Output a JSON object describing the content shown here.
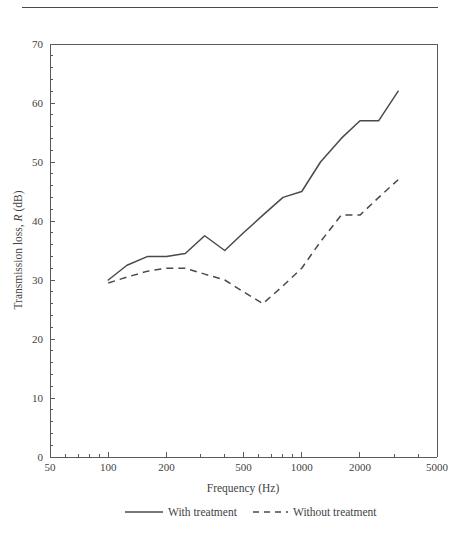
{
  "figure": {
    "has_top_rule": true,
    "background_color": "#ffffff",
    "line_color": "#4a4a4a"
  },
  "chart_data": {
    "type": "line",
    "title": "",
    "xlabel": "Frequency (Hz)",
    "ylabel": "Transmission loss, R (dB)",
    "ylabel_parts": {
      "prefix": "Transmission loss, ",
      "italic": "R",
      "suffix": " (dB)"
    },
    "xscale": "log",
    "yscale": "linear",
    "xlim": [
      50,
      5000
    ],
    "ylim": [
      0,
      70
    ],
    "grid": false,
    "legend_position": "bottom-outside",
    "x_ticks": [
      50,
      100,
      200,
      500,
      1000,
      2000,
      5000
    ],
    "x_tick_labels": [
      "50",
      "100",
      "200",
      "500",
      "1000",
      "2000",
      "5000"
    ],
    "y_ticks": [
      0,
      10,
      20,
      30,
      40,
      50,
      60,
      70
    ],
    "y_tick_labels": [
      "0",
      "10",
      "20",
      "30",
      "40",
      "50",
      "60",
      "70"
    ],
    "y_minor_tick_step": 2,
    "series": [
      {
        "name": "With treatment",
        "style": "solid",
        "color": "#4a4a4a",
        "x": [
          100,
          125,
          160,
          200,
          250,
          315,
          400,
          500,
          630,
          800,
          1000,
          1250,
          1600,
          2000,
          2500,
          3150
        ],
        "values": [
          30.0,
          32.5,
          34.0,
          34.0,
          34.5,
          37.5,
          35.0,
          38.0,
          41.0,
          44.0,
          45.0,
          50.0,
          54.0,
          57.0,
          57.0,
          62.0
        ]
      },
      {
        "name": "Without treatment",
        "style": "dashed",
        "color": "#4a4a4a",
        "x": [
          100,
          125,
          160,
          200,
          250,
          315,
          400,
          500,
          630,
          800,
          1000,
          1250,
          1600,
          2000,
          2500,
          3150
        ],
        "values": [
          29.5,
          30.5,
          31.5,
          32.0,
          32.0,
          31.0,
          30.0,
          28.0,
          26.0,
          29.0,
          32.0,
          36.5,
          41.0,
          41.0,
          44.0,
          47.0
        ]
      }
    ]
  },
  "legend": {
    "items": [
      {
        "label": "With treatment",
        "style": "solid"
      },
      {
        "label": "Without treatment",
        "style": "dashed"
      }
    ]
  }
}
